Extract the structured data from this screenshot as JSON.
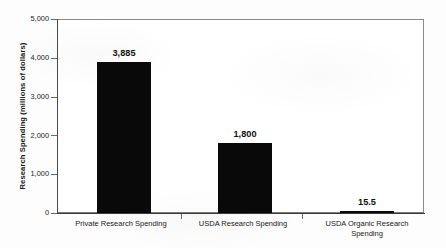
{
  "chart_data": {
    "type": "bar",
    "title": "",
    "xlabel": "",
    "ylabel": "Research Spending (millions of dollars)",
    "categories": [
      "Private Research Spending",
      "USDA Research Spending",
      "USDA Organic Research Spending"
    ],
    "values": [
      3885,
      1800,
      15.5
    ],
    "value_labels": [
      "3,885",
      "1,800",
      "15.5"
    ],
    "ylim": [
      0,
      5000
    ],
    "yticks": [
      0,
      1000,
      2000,
      3000,
      4000,
      5000
    ],
    "ytick_labels": [
      "0",
      "1,000",
      "2,000",
      "3,000",
      "4,000",
      "5,000"
    ],
    "grid": false,
    "legend": false,
    "bar_color": "#090909",
    "axis_color": "#4a4a4a",
    "series": [
      {
        "name": "Research Spending",
        "values": [
          3885,
          1800,
          15.5
        ]
      }
    ]
  }
}
